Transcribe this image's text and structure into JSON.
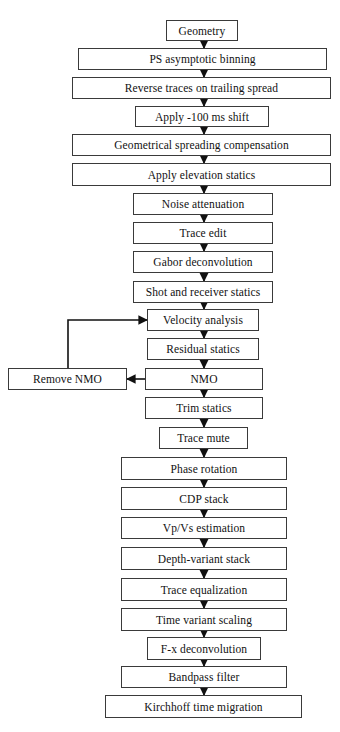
{
  "diagram": {
    "type": "flowchart",
    "colors": {
      "line": "#111111",
      "box_border": "#3a3a3a",
      "background": "#ffffff",
      "text": "#111111"
    },
    "nodes": [
      {
        "id": "n0",
        "label": "Geometry",
        "x": 166,
        "y": 20,
        "w": 72,
        "h": 21
      },
      {
        "id": "n1",
        "label": "PS asymptotic binning",
        "x": 78,
        "y": 48,
        "w": 249,
        "h": 22
      },
      {
        "id": "n2",
        "label": "Reverse traces on trailing spread",
        "x": 72,
        "y": 77,
        "w": 259,
        "h": 22
      },
      {
        "id": "n3",
        "label": "Apply -100 ms shift",
        "x": 135,
        "y": 106,
        "w": 134,
        "h": 21
      },
      {
        "id": "n4",
        "label": "Geometrical spreading compensation",
        "x": 72,
        "y": 134,
        "w": 259,
        "h": 22
      },
      {
        "id": "n5",
        "label": "Apply elevation statics",
        "x": 72,
        "y": 163,
        "w": 259,
        "h": 23
      },
      {
        "id": "n6",
        "label": "Noise attenuation",
        "x": 133,
        "y": 193,
        "w": 140,
        "h": 22
      },
      {
        "id": "n7",
        "label": "Trace edit",
        "x": 133,
        "y": 222,
        "w": 140,
        "h": 22
      },
      {
        "id": "n8",
        "label": "Gabor deconvolution",
        "x": 133,
        "y": 251,
        "w": 140,
        "h": 22
      },
      {
        "id": "n9",
        "label": "Shot and receiver statics",
        "x": 133,
        "y": 281,
        "w": 140,
        "h": 22
      },
      {
        "id": "n10",
        "label": "Velocity analysis",
        "x": 147,
        "y": 309,
        "w": 112,
        "h": 22
      },
      {
        "id": "n11",
        "label": "Residual statics",
        "x": 147,
        "y": 338,
        "w": 112,
        "h": 22
      },
      {
        "id": "n12",
        "label": "NMO",
        "x": 145,
        "y": 368,
        "w": 118,
        "h": 22
      },
      {
        "id": "n13",
        "label": "Trim statics",
        "x": 145,
        "y": 397,
        "w": 118,
        "h": 22
      },
      {
        "id": "n14",
        "label": "Trace mute",
        "x": 159,
        "y": 427,
        "w": 89,
        "h": 22
      },
      {
        "id": "n15",
        "label": "Phase rotation",
        "x": 121,
        "y": 457,
        "w": 166,
        "h": 23
      },
      {
        "id": "n16",
        "label": "CDP stack",
        "x": 121,
        "y": 487,
        "w": 166,
        "h": 23
      },
      {
        "id": "n17",
        "label": "Vp/Vs estimation",
        "x": 121,
        "y": 517,
        "w": 166,
        "h": 22
      },
      {
        "id": "n18",
        "label": "Depth-variant stack",
        "x": 121,
        "y": 547,
        "w": 166,
        "h": 23
      },
      {
        "id": "n19",
        "label": "Trace equalization",
        "x": 121,
        "y": 578,
        "w": 166,
        "h": 23
      },
      {
        "id": "n20",
        "label": "Time variant scaling",
        "x": 121,
        "y": 608,
        "w": 166,
        "h": 23
      },
      {
        "id": "n21",
        "label": "F-x deconvolution",
        "x": 147,
        "y": 637,
        "w": 114,
        "h": 23
      },
      {
        "id": "n22",
        "label": "Bandpass filter",
        "x": 121,
        "y": 666,
        "w": 166,
        "h": 22
      },
      {
        "id": "n23",
        "label": "Kirchhoff time migration",
        "x": 105,
        "y": 695,
        "w": 197,
        "h": 23
      }
    ],
    "side_nodes": [
      {
        "id": "s0",
        "label": "Remove NMO",
        "x": 8,
        "y": 368,
        "w": 119,
        "h": 22
      }
    ],
    "edges": [
      {
        "from": "n0",
        "to": "n1"
      },
      {
        "from": "n1",
        "to": "n2"
      },
      {
        "from": "n2",
        "to": "n3"
      },
      {
        "from": "n3",
        "to": "n4"
      },
      {
        "from": "n4",
        "to": "n5"
      },
      {
        "from": "n5",
        "to": "n6"
      },
      {
        "from": "n6",
        "to": "n7"
      },
      {
        "from": "n7",
        "to": "n8"
      },
      {
        "from": "n8",
        "to": "n9"
      },
      {
        "from": "n9",
        "to": "n10"
      },
      {
        "from": "n10",
        "to": "n11"
      },
      {
        "from": "n11",
        "to": "n12"
      },
      {
        "from": "n12",
        "to": "n13"
      },
      {
        "from": "n13",
        "to": "n14"
      },
      {
        "from": "n14",
        "to": "n15"
      },
      {
        "from": "n15",
        "to": "n16"
      },
      {
        "from": "n16",
        "to": "n17"
      },
      {
        "from": "n17",
        "to": "n18"
      },
      {
        "from": "n18",
        "to": "n19"
      },
      {
        "from": "n19",
        "to": "n20"
      },
      {
        "from": "n20",
        "to": "n21"
      },
      {
        "from": "n21",
        "to": "n22"
      },
      {
        "from": "n22",
        "to": "n23"
      },
      {
        "from": "n12",
        "to": "s0",
        "kind": "side-left"
      },
      {
        "from": "s0",
        "to": "n10",
        "kind": "loop-back"
      }
    ]
  }
}
